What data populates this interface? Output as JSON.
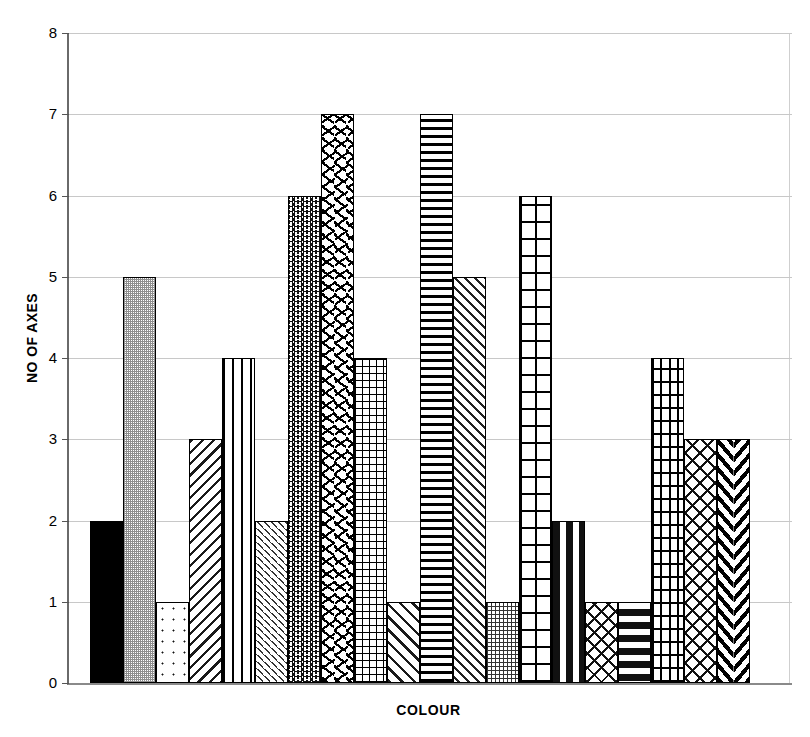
{
  "chart_data": {
    "type": "bar",
    "title": "",
    "xlabel": "COLOUR",
    "ylabel": "NO OF AXES",
    "ylim": [
      0,
      8
    ],
    "ytick_labels": [
      "0",
      "1",
      "2",
      "3",
      "4",
      "5",
      "6",
      "7",
      "8"
    ],
    "yticks": [
      0,
      1,
      2,
      3,
      4,
      5,
      6,
      7,
      8
    ],
    "grid": "horizontal",
    "legend": "none",
    "xtick_labels": [],
    "categories": [
      "bar-1",
      "bar-2",
      "bar-3",
      "bar-4",
      "bar-5",
      "bar-6",
      "bar-7",
      "bar-8",
      "bar-9",
      "bar-10",
      "bar-11",
      "bar-12",
      "bar-13",
      "bar-14",
      "bar-15",
      "bar-16",
      "bar-17",
      "bar-18",
      "bar-19",
      "bar-20"
    ],
    "values": [
      2,
      5,
      1,
      3,
      4,
      2,
      6,
      7,
      4,
      1,
      7,
      5,
      1,
      6,
      2,
      1,
      1,
      4,
      3,
      3
    ],
    "bar_fills": [
      "solid-black",
      "gray-dither",
      "dots-sparse",
      "diagonal-hatch-backslash",
      "vertical-lines",
      "short-diagonal-dashes",
      "zigzag-wave",
      "confetti-sprinkle",
      "fine-grid",
      "diagonal-hatch-forwardslash",
      "heavy-horizontal-lines",
      "slanted-dashes",
      "dotted-grid",
      "heavy-checkerboard-grid",
      "horizontal-dashes",
      "weave-lattice",
      "vertical-dashes",
      "brick",
      "fish-scales",
      "chevron-herringbone"
    ],
    "colors": {
      "bar_outline": "#000000",
      "bar_background": "#ffffff",
      "solid_bar": "#000000",
      "gray_bar": "#8f8f8f",
      "gridline": "#c8c8c8",
      "axis": "#6a6a6a",
      "plot_background": "#ffffff",
      "text": "#000000"
    }
  }
}
